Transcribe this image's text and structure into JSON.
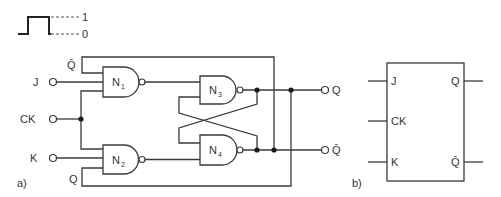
{
  "legend": {
    "high_label": "1",
    "low_label": "0"
  },
  "circuit_a": {
    "caption": "a)",
    "inputs": {
      "j": "J",
      "ck": "CK",
      "k": "K"
    },
    "feedback_labels": {
      "top": "Q̄",
      "bottom": "Q"
    },
    "gates": [
      {
        "name": "N",
        "sub": "1"
      },
      {
        "name": "N",
        "sub": "2"
      },
      {
        "name": "N",
        "sub": "3"
      },
      {
        "name": "N",
        "sub": "4"
      }
    ],
    "outputs": {
      "q": "Q",
      "qbar": "Q̄"
    }
  },
  "symbol_b": {
    "caption": "b)",
    "pins_left": [
      "J",
      "CK",
      "K"
    ],
    "pins_right": [
      "Q",
      "Q̄"
    ]
  }
}
